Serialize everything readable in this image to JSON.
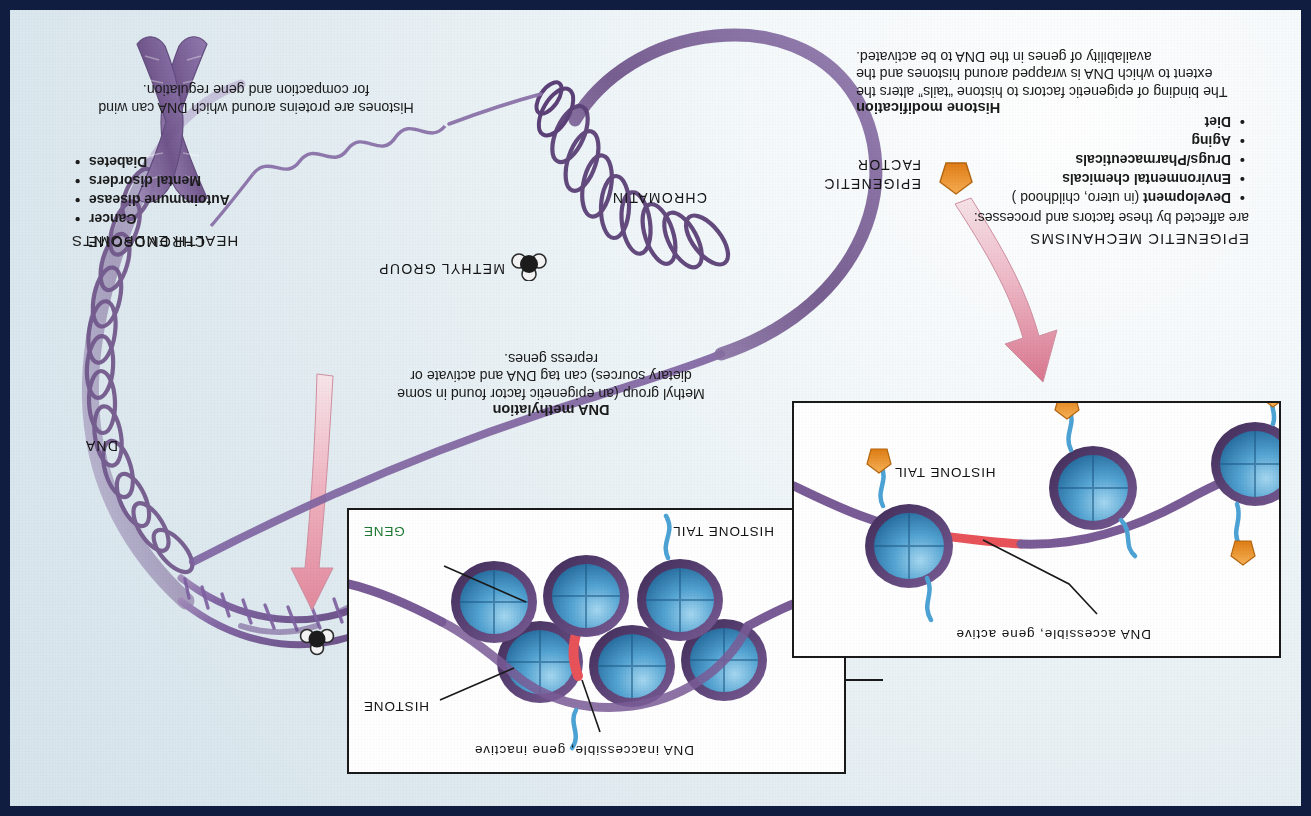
{
  "poster": {
    "title_hidden": "Epigenetic mechanisms diagram",
    "frame_color": "#101c40",
    "background_color": "#e2ecf1"
  },
  "sections": {
    "mechanisms": {
      "heading": "EPIGENETIC MECHANISMS",
      "lead": "are affected by these factors and processes:",
      "items": [
        {
          "bold": "Development",
          "rest": " (in utero, childhood )"
        },
        {
          "bold": "Environmental chemicals",
          "rest": ""
        },
        {
          "bold": "Drugs/Pharmaceuticals",
          "rest": ""
        },
        {
          "bold": "Aging",
          "rest": ""
        },
        {
          "bold": "Diet",
          "rest": ""
        }
      ]
    },
    "health": {
      "heading": "HEALTH ENDPOINTS",
      "items": [
        "Cancer",
        "Autoimmune disease",
        "Mental disorders",
        "Diabetes"
      ]
    }
  },
  "callouts": {
    "dna_methylation": {
      "title": "DNA methylation",
      "body": "Methyl group (an epigenetic factor found in some dietary sources) can tag DNA and activate or repress genes."
    },
    "histone_modification": {
      "title": "Histone modification",
      "body": "The binding of epigenetic factors to histone “tails” alters the extent to which DNA is wrapped around histones and the availability of genes in the DNA to be activated."
    },
    "histone_note": {
      "body": "Histones are proteins around which DNA can wind for compaction and gene regulation."
    }
  },
  "panels": {
    "closed": {
      "state_label": "DNA inaccessible, gene inactive",
      "histone_label": "HISTONE",
      "histone_tail_label": "HISTONE TAIL",
      "gene_label": "GENE",
      "gene_color": "#1f7a34"
    },
    "open": {
      "state_label": "DNA accessible, gene active",
      "histone_tail_label": "HISTONE TAIL"
    }
  },
  "diagram_labels": {
    "chromosome": "CHROMOSOME",
    "dna": "DNA",
    "chromatin": "CHROMATIN",
    "methyl_group": "METHYL GROUP",
    "epigenetic_factor_line1": "EPIGENETIC",
    "epigenetic_factor_line2": "FACTOR"
  },
  "colors": {
    "histone_blue": "#3f93c6",
    "dna_purple": "#7a5b93",
    "chromatin_purple": "#6f5386",
    "arrow_pink": "#e0899f",
    "epigenetic_orange": "#f0912f",
    "gene_red": "#e8535a",
    "gene_green": "#1f7a34",
    "navy_frame": "#101c40"
  }
}
